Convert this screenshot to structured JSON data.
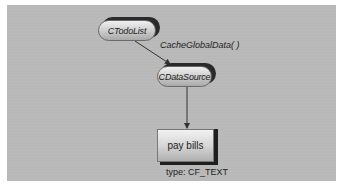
{
  "diagram": {
    "nodes": [
      {
        "id": "ctodolist",
        "label": "CTodoList",
        "shape": "pill"
      },
      {
        "id": "cdatasource",
        "label": "CDataSource",
        "shape": "pill"
      },
      {
        "id": "paybills",
        "label": "pay bills",
        "shape": "box"
      }
    ],
    "edges": [
      {
        "from": "ctodolist",
        "to": "cdatasource",
        "label": "CacheGlobalData( )"
      },
      {
        "from": "cdatasource",
        "to": "paybills",
        "label": ""
      }
    ],
    "annotations": {
      "paybills_type": "type: CF_TEXT"
    },
    "colors": {
      "panel_background": "#b8b8b8",
      "node_shadow": "#2a2a2a",
      "arrow": "#333333"
    }
  }
}
